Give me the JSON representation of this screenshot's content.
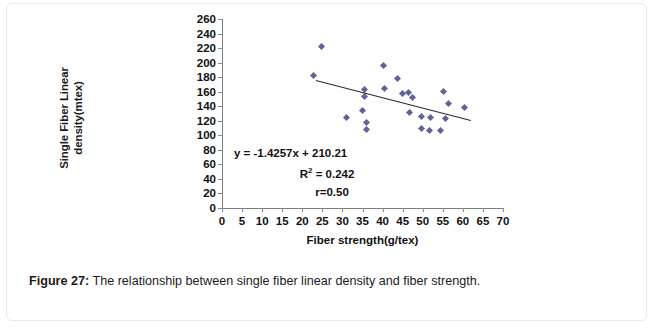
{
  "figure": {
    "caption_label": "Figure 27:",
    "caption_text": " The relationship between single fiber linear density and fiber strength."
  },
  "annotations": {
    "equation": "y = -1.4257x + 210.21",
    "r_squared_prefix": "R",
    "r_squared_exp": "2",
    "r_squared_value": " = 0.242",
    "correlation": "r=0.50"
  },
  "chart_data": {
    "type": "scatter",
    "title": "",
    "xlabel": "Fiber strength(g/tex)",
    "ylabel": "Single Fiber Linear density(mtex)",
    "ylabel_line1": "Single Fiber Linear",
    "ylabel_line2": "density(mtex)",
    "xlim": [
      0,
      70
    ],
    "ylim": [
      0,
      260
    ],
    "xticks": [
      0,
      5,
      10,
      15,
      20,
      25,
      30,
      35,
      40,
      45,
      50,
      55,
      60,
      65,
      70
    ],
    "yticks": [
      0,
      20,
      40,
      60,
      80,
      100,
      120,
      140,
      160,
      180,
      200,
      220,
      240,
      260
    ],
    "grid": false,
    "legend": false,
    "marker": "diamond",
    "marker_color": "#62629b",
    "trendline_color": "#2b2b2b",
    "trendline": {
      "slope": -1.4257,
      "intercept": 210.21,
      "x_start": 23.5,
      "x_end": 62.0,
      "r_squared": 0.242,
      "r": 0.5
    },
    "points": [
      {
        "x": 24.8,
        "y": 222
      },
      {
        "x": 22.9,
        "y": 182
      },
      {
        "x": 31.0,
        "y": 124
      },
      {
        "x": 35.4,
        "y": 163
      },
      {
        "x": 35.4,
        "y": 153
      },
      {
        "x": 35.1,
        "y": 134
      },
      {
        "x": 35.9,
        "y": 117
      },
      {
        "x": 35.9,
        "y": 108
      },
      {
        "x": 40.2,
        "y": 196
      },
      {
        "x": 40.5,
        "y": 164
      },
      {
        "x": 43.8,
        "y": 178
      },
      {
        "x": 45.0,
        "y": 157
      },
      {
        "x": 46.5,
        "y": 159
      },
      {
        "x": 47.5,
        "y": 152
      },
      {
        "x": 46.8,
        "y": 131
      },
      {
        "x": 49.7,
        "y": 126
      },
      {
        "x": 49.7,
        "y": 109
      },
      {
        "x": 51.8,
        "y": 106
      },
      {
        "x": 52.0,
        "y": 125
      },
      {
        "x": 54.5,
        "y": 107
      },
      {
        "x": 55.2,
        "y": 160
      },
      {
        "x": 56.3,
        "y": 144
      },
      {
        "x": 55.8,
        "y": 123
      },
      {
        "x": 60.3,
        "y": 138
      }
    ]
  }
}
